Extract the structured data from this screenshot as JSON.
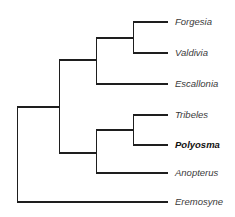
{
  "diagram": {
    "type": "phylogenetic-tree",
    "tips": [
      {
        "id": "forgesia",
        "label": "Forgesia",
        "y": 22,
        "highlight": false
      },
      {
        "id": "valdivia",
        "label": "Valdivia",
        "y": 53,
        "highlight": false
      },
      {
        "id": "escallonia",
        "label": "Escallonia",
        "y": 84,
        "highlight": false
      },
      {
        "id": "tribeles",
        "label": "Tribeles",
        "y": 115,
        "highlight": false
      },
      {
        "id": "polyosma",
        "label": "Polyosma",
        "y": 145,
        "highlight": true
      },
      {
        "id": "anopterus",
        "label": "Anopterus",
        "y": 173,
        "highlight": false
      },
      {
        "id": "eremosyne",
        "label": "Eremosyne",
        "y": 202,
        "highlight": false
      }
    ],
    "topology": "(((( Forgesia, Valdivia ), Escallonia ), (( Tribeles, Polyosma ), Anopterus )), Eremosyne )",
    "line_color": "#1e1e1e"
  }
}
